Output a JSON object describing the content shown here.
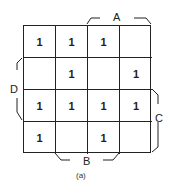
{
  "kmap": {
    "cells": [
      [
        "1",
        "1",
        "1",
        ""
      ],
      [
        "",
        "1",
        "",
        "1"
      ],
      [
        "1",
        "1",
        "1",
        "1"
      ],
      [
        "1",
        "",
        "1",
        ""
      ]
    ],
    "labels": {
      "A": "A",
      "B": "B",
      "C": "C",
      "D": "D"
    }
  },
  "caption": "(a)"
}
